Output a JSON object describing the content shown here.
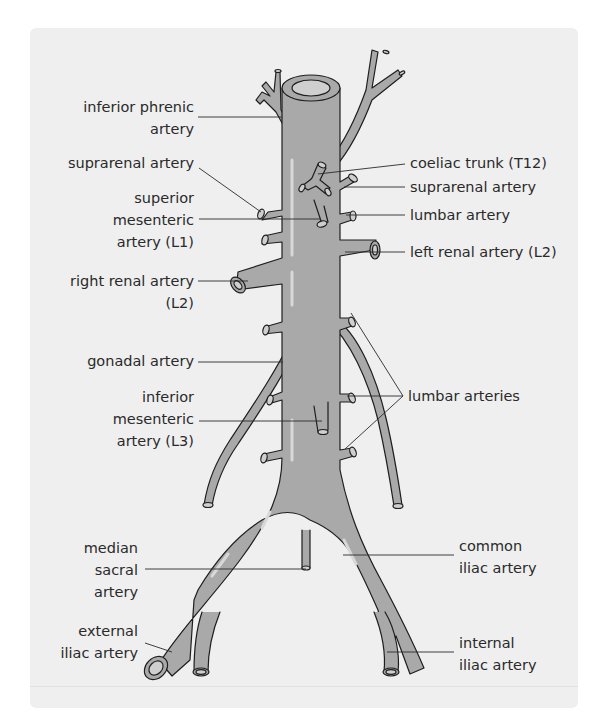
{
  "figure": {
    "colors": {
      "background": "#efefef",
      "artery_fill": "#a9a9a9",
      "artery_lumen": "#cfcfcf",
      "highlight": "#d8d8d8",
      "outline": "#1e1e1e",
      "text": "#2a2a2a"
    }
  },
  "labels": {
    "inferior_phrenic": {
      "line1": "inferior phrenic",
      "line2": "artery"
    },
    "suprarenal_left_side": {
      "line1": "suprarenal artery"
    },
    "superior_mesenteric": {
      "line1": "superior",
      "line2": "mesenteric",
      "line3": "artery (L1)"
    },
    "right_renal": {
      "line1": "right renal artery",
      "line2": "(L2)"
    },
    "gonadal": {
      "line1": "gonadal artery"
    },
    "inferior_mesenteric": {
      "line1": "inferior",
      "line2": "mesenteric",
      "line3": "artery (L3)"
    },
    "median_sacral": {
      "line1": "median",
      "line2": "sacral",
      "line3": "artery"
    },
    "external_iliac": {
      "line1": "external",
      "line2": "iliac artery"
    },
    "coeliac_trunk": {
      "line1": "coeliac trunk (T12)"
    },
    "suprarenal_right_side": {
      "line1": "suprarenal artery"
    },
    "lumbar": {
      "line1": "lumbar artery"
    },
    "left_renal": {
      "line1": "left renal artery (L2)"
    },
    "lumbar_arteries": {
      "line1": "lumbar arteries"
    },
    "common_iliac": {
      "line1": "common",
      "line2": "iliac artery"
    },
    "internal_iliac": {
      "line1": "internal",
      "line2": "iliac artery"
    }
  }
}
